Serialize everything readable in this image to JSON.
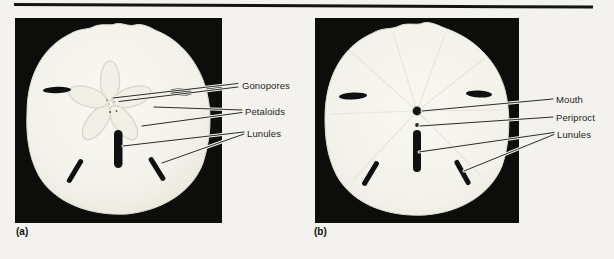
{
  "figure": {
    "panels": [
      {
        "caption": "(a)",
        "photo": "sand dollar test, aboral (top) surface",
        "labels": [
          {
            "text": "Gonopores"
          },
          {
            "text": "Petaloids"
          },
          {
            "text": "Lunules"
          }
        ]
      },
      {
        "caption": "(b)",
        "photo": "sand dollar test, oral (bottom) surface",
        "labels": [
          {
            "text": "Mouth"
          },
          {
            "text": "Periproct"
          },
          {
            "text": "Lunules"
          }
        ]
      }
    ],
    "colors": {
      "paper": "#f3f2ee",
      "photo_background": "#0d0d0c",
      "specimen": "#f5f4ed",
      "specimen_detail": "#d9d8ca",
      "label_text": "#1d1d1b",
      "leader_line": "#2e2d2b",
      "rule": "#141413"
    }
  }
}
